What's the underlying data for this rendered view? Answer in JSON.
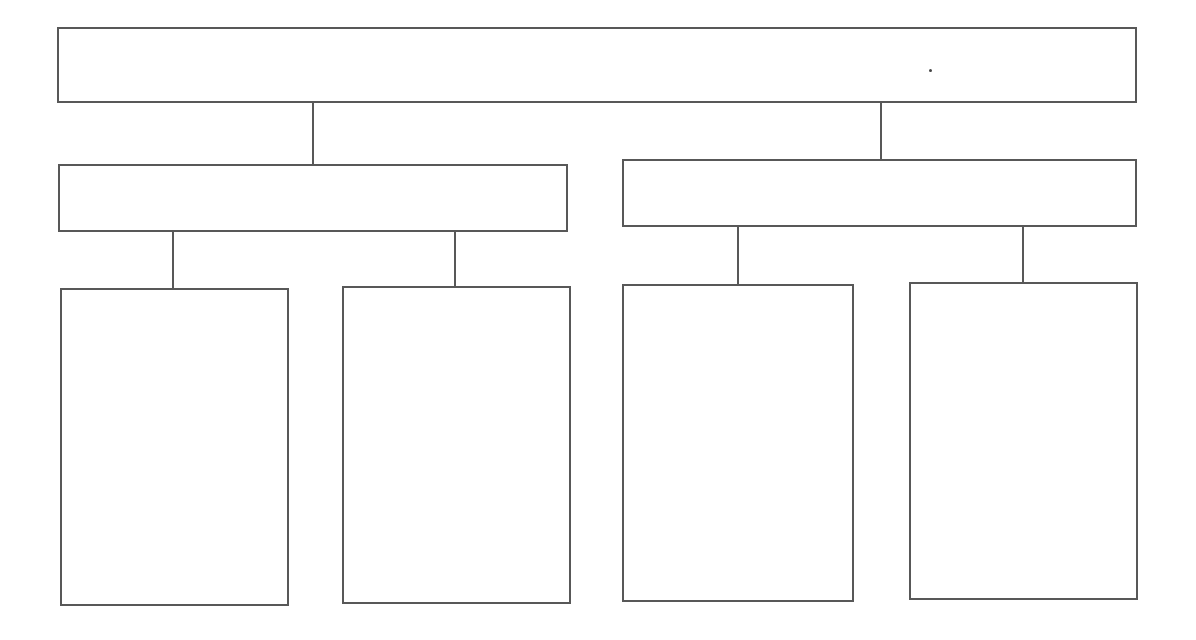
{
  "diagram": {
    "type": "tree-graphic-organizer",
    "stroke_color": "#585858",
    "background": "#ffffff",
    "root": {
      "label": "",
      "x": 57,
      "y": 27,
      "w": 1080,
      "h": 76
    },
    "level1": [
      {
        "label": "",
        "x": 58,
        "y": 164,
        "w": 510,
        "h": 68
      },
      {
        "label": "",
        "x": 622,
        "y": 159,
        "w": 515,
        "h": 68
      }
    ],
    "level2": [
      {
        "label": "",
        "x": 60,
        "y": 288,
        "w": 229,
        "h": 318
      },
      {
        "label": "",
        "x": 342,
        "y": 286,
        "w": 229,
        "h": 318
      },
      {
        "label": "",
        "x": 622,
        "y": 284,
        "w": 232,
        "h": 318
      },
      {
        "label": "",
        "x": 909,
        "y": 282,
        "w": 229,
        "h": 318
      }
    ],
    "connectors": [
      {
        "x": 312,
        "y1": 102,
        "y2": 165
      },
      {
        "x": 880,
        "y1": 100,
        "y2": 160
      },
      {
        "x": 172,
        "y1": 231,
        "y2": 289
      },
      {
        "x": 454,
        "y1": 229,
        "y2": 287
      },
      {
        "x": 737,
        "y1": 226,
        "y2": 285
      },
      {
        "x": 1022,
        "y1": 225,
        "y2": 283
      }
    ]
  }
}
